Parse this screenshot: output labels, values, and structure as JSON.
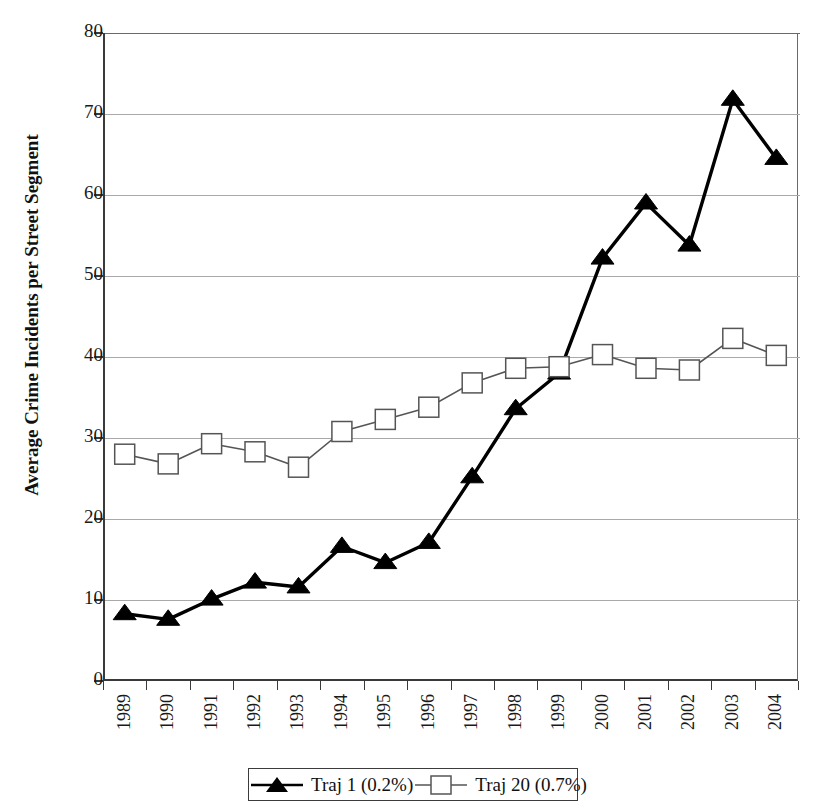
{
  "chart_data": {
    "type": "line",
    "title": "",
    "subtitle": "",
    "xlabel": "",
    "ylabel": "Average Crime Incidents per Street Segment",
    "categories": [
      "1989",
      "1990",
      "1991",
      "1992",
      "1993",
      "1994",
      "1995",
      "1996",
      "1997",
      "1998",
      "1999",
      "2000",
      "2001",
      "2002",
      "2003",
      "2004"
    ],
    "x_tick_labels": [
      "1989",
      "1990",
      "1991",
      "1992",
      "1993",
      "1994",
      "1995",
      "1996",
      "1997",
      "1998",
      "1999",
      "2000",
      "2001",
      "2002",
      "2003",
      "2004"
    ],
    "y_tick_labels": [
      "0",
      "10",
      "20",
      "30",
      "40",
      "50",
      "60",
      "70",
      "80"
    ],
    "y_ticks": [
      0,
      10,
      20,
      30,
      40,
      50,
      60,
      70,
      80
    ],
    "ylim": [
      0,
      80
    ],
    "grid": "horizontal",
    "legend_position": "bottom-center",
    "series": [
      {
        "name": "Traj 1 (0.2%)",
        "marker": "filled-triangle",
        "color": "#000000",
        "values": [
          8.3,
          7.6,
          10.1,
          12.2,
          11.6,
          16.6,
          14.6,
          17.1,
          25.2,
          33.6,
          38.0,
          52.2,
          59.0,
          53.8,
          71.8,
          64.5
        ]
      },
      {
        "name": "Traj 20 (0.7%)",
        "marker": "open-square",
        "color": "#555555",
        "values": [
          28.0,
          26.8,
          29.3,
          28.3,
          26.4,
          30.8,
          32.3,
          33.8,
          36.8,
          38.6,
          38.8,
          40.3,
          38.6,
          38.4,
          42.3,
          40.2
        ]
      }
    ],
    "legend": [
      {
        "label": "Traj 1 (0.2%)",
        "marker": "filled-triangle"
      },
      {
        "label": "Traj 20 (0.7%)",
        "marker": "open-square"
      }
    ],
    "colors": {
      "traj1": "#000000",
      "traj20": "#555555",
      "grid": "#a9a9a9",
      "axis": "#3a3a3a",
      "background": "#ffffff"
    }
  }
}
